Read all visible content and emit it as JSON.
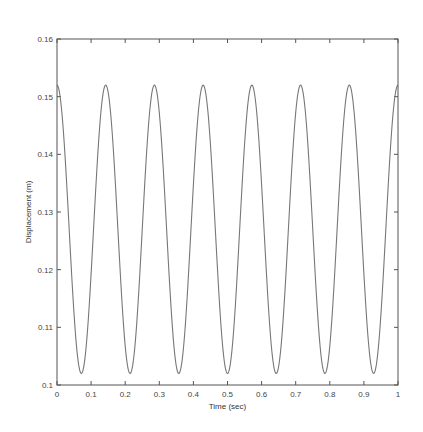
{
  "chart_data": {
    "type": "line",
    "title": "",
    "xlabel": "Time (sec)",
    "ylabel": "Displacement (m)",
    "xlim": [
      0,
      1
    ],
    "ylim": [
      0.1,
      0.16
    ],
    "xticks": [
      0,
      0.1,
      0.2,
      0.3,
      0.4,
      0.5,
      0.6,
      0.7,
      0.8,
      0.9,
      1
    ],
    "xtick_labels": [
      "0",
      "0.1",
      "0.2",
      "0.3",
      "0.4",
      "0.5",
      "0.6",
      "0.7",
      "0.8",
      "0.9",
      "1"
    ],
    "yticks": [
      0.1,
      0.11,
      0.12,
      0.13,
      0.14,
      0.15,
      0.16
    ],
    "ytick_labels": [
      "0.1",
      "0.11",
      "0.12",
      "0.13",
      "0.14",
      "0.15",
      "0.16"
    ],
    "grid": false,
    "legend": null,
    "series": [
      {
        "name": "displacement",
        "color": "#777777",
        "description": "Cosine oscillation, ~7 cycles over 1 s, peaks ~0.152 m, troughs ~0.102 m",
        "model": {
          "mean": 0.127,
          "amplitude": 0.025,
          "frequency_hz": 7,
          "phase": 0
        },
        "peaks_x": [
          0,
          0.143,
          0.286,
          0.429,
          0.571,
          0.714,
          0.857,
          1.0
        ],
        "peak_y": 0.152,
        "troughs_x": [
          0.071,
          0.214,
          0.357,
          0.5,
          0.643,
          0.786,
          0.929
        ],
        "trough_y": 0.102
      }
    ]
  },
  "layout": {
    "plot": {
      "left": 57,
      "top": 39,
      "right": 398,
      "bottom": 385
    }
  }
}
